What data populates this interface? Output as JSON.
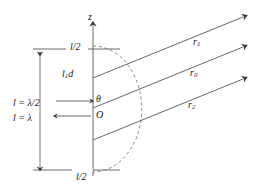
{
  "figure": {
    "axis": {
      "vertical_axis_label": "z",
      "origin_label": "O",
      "angle_label": "θ"
    },
    "ticks": {
      "top_label": "l/2",
      "bottom_label": "l/2"
    },
    "dimension_labels": [
      "l = λ/2",
      "l = λ"
    ],
    "element_label": {
      "base": "l",
      "sub": "1",
      "suffix": "d"
    },
    "rays": [
      {
        "name": "ray-upper",
        "base": "r",
        "sub": "1"
      },
      {
        "name": "ray-middle",
        "base": "r",
        "sub": "0"
      },
      {
        "name": "ray-lower",
        "base": "r",
        "sub": "2"
      }
    ],
    "colors": {
      "line": "#55585c",
      "text": "#1a1a1a",
      "background": "#ffffff",
      "dashed": "#6b6e72"
    }
  }
}
